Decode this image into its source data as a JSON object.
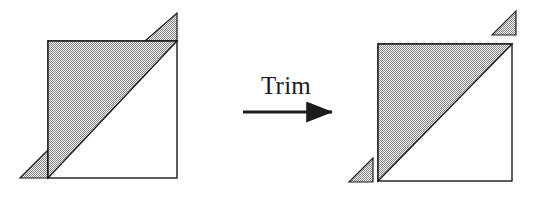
{
  "figure": {
    "width": 538,
    "height": 207,
    "background": "#ffffff",
    "operation_label": "Trim",
    "style": {
      "fill_pattern": "50% checkerboard dither gray",
      "fill_color_apparent": "#9a9a9a",
      "fill_dither_dark": "#7d7d7d",
      "fill_dither_light": "#ffffff",
      "stroke_color": "#1b1b1b",
      "stroke_width": 1.4,
      "text_color": "#1b1b1b"
    },
    "arrow": {
      "x1": 243,
      "y1": 112,
      "x2": 340,
      "y2": 112,
      "head_length": 16,
      "head_width": 11,
      "shaft_width": 3
    }
  },
  "panels": [
    {
      "id": "before",
      "name": "untrimmed-shape",
      "square": {
        "x": 48,
        "y": 41,
        "width": 129,
        "height": 137
      },
      "shaded_triangle": [
        [
          48,
          41
        ],
        [
          177,
          41
        ],
        [
          48,
          178
        ]
      ],
      "overhang_triangles": [
        {
          "name": "top-right-overhang",
          "attached": true,
          "points": [
            [
              145,
              41
            ],
            [
              177,
              41
            ],
            [
              177,
              13
            ]
          ]
        },
        {
          "name": "bottom-left-overhang",
          "attached": true,
          "points": [
            [
              20,
              178
            ],
            [
              48,
              178
            ],
            [
              48,
              150
            ]
          ]
        }
      ]
    },
    {
      "id": "after",
      "name": "trimmed-shape",
      "square": {
        "x": 378,
        "y": 44,
        "width": 134,
        "height": 137
      },
      "shaded_triangle": [
        [
          378,
          44
        ],
        [
          512,
          44
        ],
        [
          378,
          181
        ]
      ],
      "overhang_triangles": [
        {
          "name": "top-right-offcut",
          "attached": false,
          "points": [
            [
              492,
              35
            ],
            [
              516,
              35
            ],
            [
              516,
              11
            ]
          ]
        },
        {
          "name": "bottom-left-offcut",
          "attached": false,
          "points": [
            [
              349,
              182
            ],
            [
              373,
              182
            ],
            [
              373,
              158
            ]
          ]
        }
      ]
    }
  ]
}
